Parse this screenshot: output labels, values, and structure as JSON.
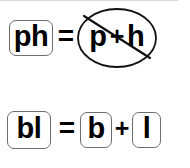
{
  "figure": {
    "frame_color": "#1a1a1a",
    "background_color": "#ffffff",
    "text_color": "#000000",
    "tile_border_color": "#6d6d6d"
  },
  "rows": [
    {
      "id": "row-ph",
      "blend_tile": "ph",
      "equals": "=",
      "negated": true,
      "negation_icon": "crossed-out-ellipse-icon",
      "parts": [
        "p",
        "h"
      ],
      "plus": "+"
    },
    {
      "id": "row-bl",
      "blend_tile": "bl",
      "equals": "=",
      "negated": false,
      "parts": [
        "b",
        "l"
      ],
      "plus": "+"
    }
  ],
  "labels": {
    "ph_tile": "ph",
    "equals_top": "=",
    "p_glyph": "p",
    "plus_top": "+",
    "h_glyph": "h",
    "bl_tile": "bl",
    "equals_bottom": "=",
    "b_tile": "b",
    "plus_bottom": "+",
    "l_tile": "l"
  }
}
